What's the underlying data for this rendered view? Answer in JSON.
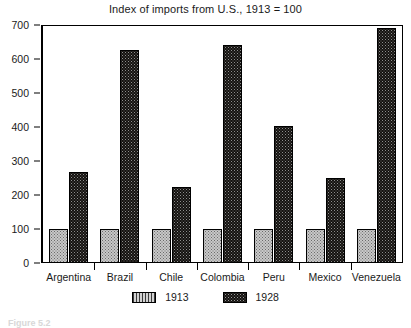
{
  "chart_data": {
    "type": "bar",
    "title": "Index of imports from U.S., 1913 = 100",
    "xlabel": "",
    "ylabel": "",
    "ylim": [
      0,
      700
    ],
    "yticks": [
      0,
      100,
      200,
      300,
      400,
      500,
      600,
      700
    ],
    "grid": false,
    "legend_position": "bottom-center",
    "categories": [
      "Argentina",
      "Brazil",
      "Chile",
      "Colombia",
      "Peru",
      "Mexico",
      "Venezuela"
    ],
    "series": [
      {
        "name": "1913",
        "color": "#c8c8c8",
        "values": [
          100,
          100,
          100,
          100,
          100,
          100,
          100
        ]
      },
      {
        "name": "1928",
        "color": "#14120f",
        "values": [
          267,
          627,
          225,
          642,
          402,
          250,
          690
        ]
      }
    ]
  },
  "legend": {
    "items": [
      {
        "label": "1913"
      },
      {
        "label": "1928"
      }
    ]
  },
  "caption": {
    "text": "Figure 5.2"
  }
}
